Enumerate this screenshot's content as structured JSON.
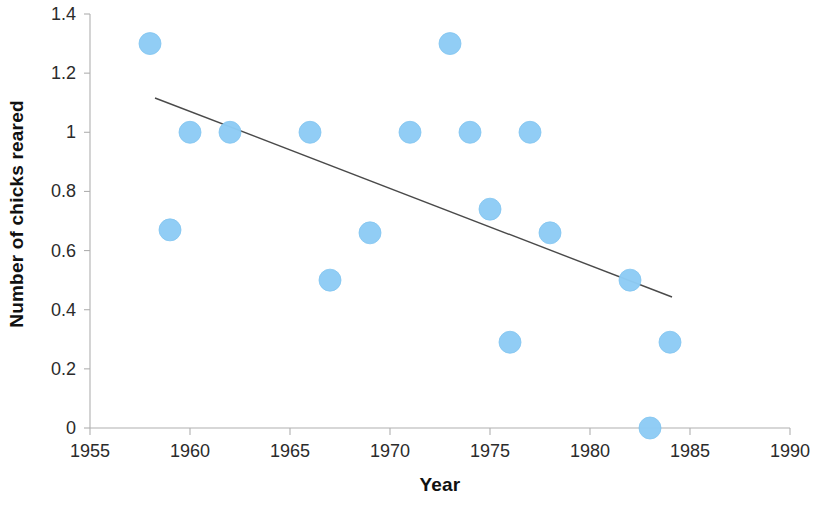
{
  "chart_data": {
    "type": "scatter",
    "title": "",
    "xlabel": "Year",
    "ylabel": "Number of chicks reared",
    "xlim": [
      1955,
      1990
    ],
    "ylim": [
      0,
      1.4
    ],
    "xticks": [
      1955,
      1960,
      1965,
      1970,
      1975,
      1980,
      1985,
      1990
    ],
    "xtick_labels": [
      "1955",
      "1960",
      "1965",
      "1970",
      "1975",
      "1980",
      "1985",
      "1990"
    ],
    "yticks": [
      0,
      0.2,
      0.4,
      0.6,
      0.8,
      1,
      1.2,
      1.4
    ],
    "ytick_labels": [
      "0",
      "0.2",
      "0.4",
      "0.6",
      "0.8",
      "1",
      "1.2",
      "1.4"
    ],
    "grid": false,
    "legend": false,
    "marker_color": "#8ECCF5",
    "trendline_color": "#4a4a4a",
    "axis_color": "#b0b0b0",
    "points": [
      {
        "x": 1958,
        "y": 1.3
      },
      {
        "x": 1959,
        "y": 0.67
      },
      {
        "x": 1960,
        "y": 1.0
      },
      {
        "x": 1962,
        "y": 1.0
      },
      {
        "x": 1966,
        "y": 1.0
      },
      {
        "x": 1967,
        "y": 0.5
      },
      {
        "x": 1969,
        "y": 0.66
      },
      {
        "x": 1971,
        "y": 1.0
      },
      {
        "x": 1973,
        "y": 1.3
      },
      {
        "x": 1974,
        "y": 1.0
      },
      {
        "x": 1975,
        "y": 0.74
      },
      {
        "x": 1976,
        "y": 0.29
      },
      {
        "x": 1977,
        "y": 1.0
      },
      {
        "x": 1978,
        "y": 0.66
      },
      {
        "x": 1982,
        "y": 0.5
      },
      {
        "x": 1983,
        "y": 0.0
      },
      {
        "x": 1984,
        "y": 0.29
      }
    ],
    "trendline": {
      "x_start": 1958.25,
      "y_start": 1.116,
      "x_end": 1984.1,
      "y_end": 0.443
    }
  }
}
